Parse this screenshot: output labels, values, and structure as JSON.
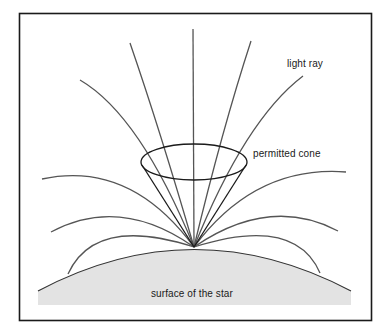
{
  "figure": {
    "type": "diagram",
    "labels": {
      "light_ray": "light ray",
      "permitted_cone": "permitted cone",
      "surface": "surface of the star"
    },
    "colors": {
      "frame": "#1a1a1a",
      "ray": "#555555",
      "cone": "#1a1a1a",
      "star_fill": "#e3e3e3",
      "star_edge": "#333333",
      "background": "#ffffff"
    },
    "elements": {
      "ray_count": 11,
      "apex": [
        194,
        247
      ]
    }
  }
}
